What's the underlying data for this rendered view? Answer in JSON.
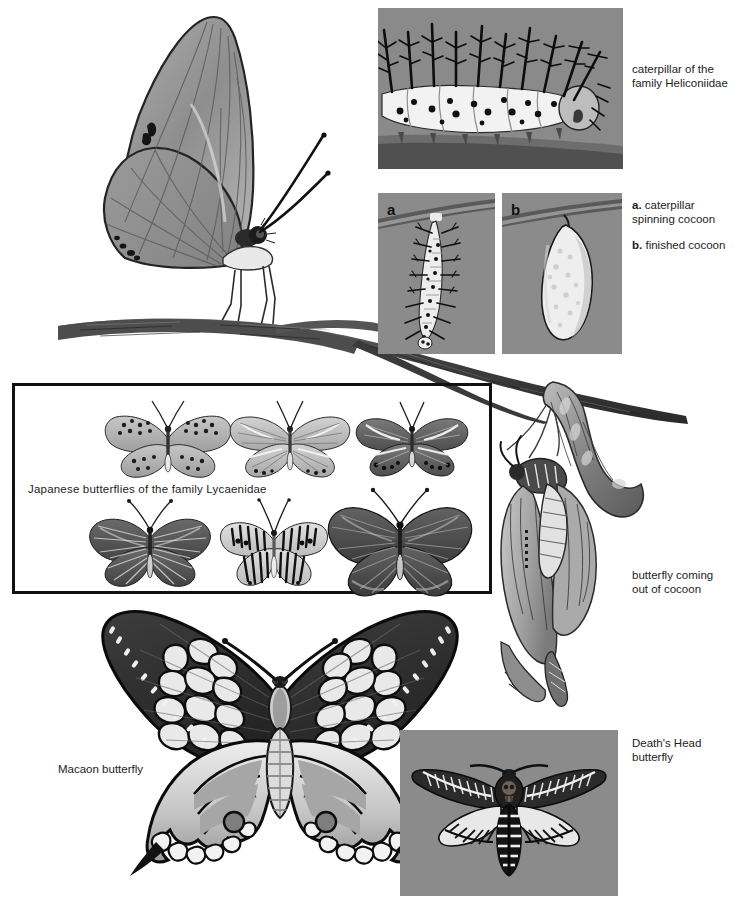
{
  "page": {
    "width": 742,
    "height": 908,
    "background": "#ffffff"
  },
  "colors": {
    "photo_background": "#8a8a8a",
    "ink": "#1d1d1d",
    "box_border": "#111111",
    "branch_dark": "#4a4a4a",
    "wing_mid": "#9a9a9a",
    "wing_light": "#d8d8d8",
    "wing_dark": "#3a3a3a"
  },
  "captions": [
    {
      "id": "caterpillar-heliconiidae",
      "lines": [
        "caterpillar of the",
        "family Heliconiidae"
      ],
      "x": 632,
      "y": 64
    },
    {
      "id": "cocoon-stages",
      "groups": [
        {
          "marker": "a.",
          "lines": [
            "caterpillar",
            "spinning cocoon"
          ]
        },
        {
          "marker": "b.",
          "lines": [
            "finished cocoon"
          ]
        }
      ],
      "x": 632,
      "y": 199
    },
    {
      "id": "butterfly-emerging",
      "lines": [
        "butterfly coming",
        "out of cocoon"
      ],
      "x": 632,
      "y": 570
    },
    {
      "id": "deaths-head",
      "lines": [
        "Death's Head",
        "butterfly"
      ],
      "x": 632,
      "y": 738
    }
  ],
  "labels": {
    "japanese_box": "Japanese butterflies of the family Lycaenidae",
    "macaon": "Macaon butterfly"
  },
  "panels": [
    {
      "id": "panel-caterpillar",
      "name": "caterpillar-photo-panel",
      "x": 378,
      "y": 8,
      "w": 245,
      "h": 161
    },
    {
      "id": "panel-a",
      "name": "caterpillar-spinning-photo-panel",
      "label": "a",
      "x": 378,
      "y": 193,
      "w": 117,
      "h": 161
    },
    {
      "id": "panel-b",
      "name": "finished-cocoon-photo-panel",
      "label": "b",
      "x": 502,
      "y": 193,
      "w": 120,
      "h": 161
    },
    {
      "id": "panel-deaths-head",
      "name": "deaths-head-photo-panel",
      "x": 400,
      "y": 730,
      "w": 218,
      "h": 166
    }
  ],
  "lycaenidae_box": {
    "x": 12,
    "y": 383,
    "w": 480,
    "h": 211
  },
  "lycaenidae_specimens": [
    {
      "index": 1,
      "row": 1,
      "col": 1,
      "pattern": "spotted-pale",
      "cx": 168,
      "cy": 437,
      "scale": 1.0,
      "tone": "#b9b9b9"
    },
    {
      "index": 2,
      "row": 1,
      "col": 2,
      "pattern": "banded-pale",
      "cx": 290,
      "cy": 437,
      "scale": 0.95,
      "tone": "#c4c4c4"
    },
    {
      "index": 3,
      "row": 1,
      "col": 3,
      "pattern": "dark-margin",
      "cx": 412,
      "cy": 437,
      "scale": 0.92,
      "tone": "#6e6e6e"
    },
    {
      "index": 4,
      "row": 2,
      "col": 1,
      "pattern": "dark-veined",
      "cx": 150,
      "cy": 538,
      "scale": 1.02,
      "tone": "#5e5e5e"
    },
    {
      "index": 5,
      "row": 2,
      "col": 2,
      "pattern": "striped-zebra",
      "cx": 272,
      "cy": 540,
      "scale": 0.95,
      "tone": "#cfcfcf"
    },
    {
      "index": 6,
      "row": 2,
      "col": 3,
      "pattern": "solid-dark",
      "cx": 400,
      "cy": 535,
      "scale": 1.15,
      "tone": "#555555"
    }
  ],
  "figures": {
    "perched_butterfly": {
      "name": "heliconiid-butterfly-side-view",
      "x": 95,
      "y": 10,
      "w": 260,
      "h": 340
    },
    "branch_main": {
      "name": "twig-branch",
      "x": 50,
      "y": 300,
      "w": 640,
      "h": 120
    },
    "emerging": {
      "name": "butterfly-emerging-from-cocoon",
      "x": 495,
      "y": 385,
      "w": 150,
      "h": 325
    },
    "macaon": {
      "name": "macaon-swallowtail-butterfly",
      "x": 78,
      "y": 600,
      "w": 400,
      "h": 275
    },
    "deaths_head_moth": {
      "name": "deaths-head-hawkmoth",
      "x": 420,
      "y": 745,
      "w": 180,
      "h": 130
    }
  }
}
